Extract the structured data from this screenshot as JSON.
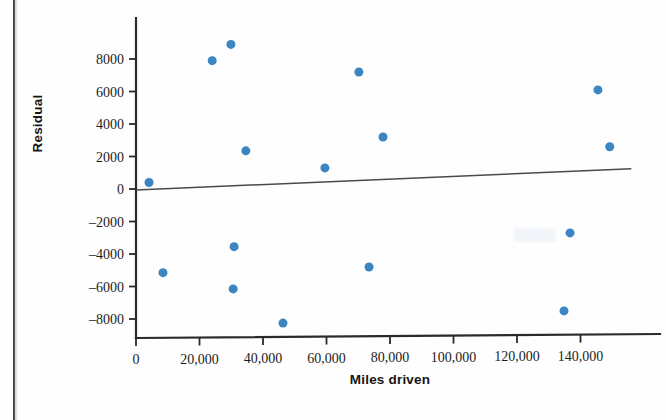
{
  "chart_data": {
    "type": "scatter",
    "title": "",
    "xlabel": "Miles driven",
    "ylabel": "Residual",
    "xlim": [
      0,
      156000
    ],
    "ylim": [
      -9200,
      9800
    ],
    "xticks": [
      0,
      20000,
      40000,
      60000,
      80000,
      100000,
      120000,
      140000
    ],
    "xticklabels": [
      "0",
      "20,000",
      "40,000",
      "60,000",
      "80,000",
      "100,000",
      "120,000",
      "140,000"
    ],
    "yticks": [
      -8000,
      -6000,
      -4000,
      -2000,
      0,
      2000,
      4000,
      6000,
      8000
    ],
    "yticklabels": [
      "–8000",
      "–6000",
      "–4000",
      "–2000",
      "0",
      "2000",
      "4000",
      "6000",
      "8000"
    ],
    "grid": false,
    "legend": null,
    "marker_color": "#3c85c3",
    "marker_size": 9,
    "reference_line": {
      "name": "residual-zero-line",
      "x": [
        0,
        156000
      ],
      "y": [
        -60,
        1250
      ],
      "color": "#4a4a4a"
    },
    "points": [
      {
        "x": 4100,
        "y": 400
      },
      {
        "x": 8500,
        "y": -5150
      },
      {
        "x": 24000,
        "y": 7900
      },
      {
        "x": 29900,
        "y": 8900
      },
      {
        "x": 30600,
        "y": -6150
      },
      {
        "x": 30900,
        "y": -3550
      },
      {
        "x": 34600,
        "y": 2350
      },
      {
        "x": 46300,
        "y": -8250
      },
      {
        "x": 59500,
        "y": 1300
      },
      {
        "x": 70200,
        "y": 7200
      },
      {
        "x": 73400,
        "y": -4800
      },
      {
        "x": 77800,
        "y": 3200
      },
      {
        "x": 134800,
        "y": -7500
      },
      {
        "x": 136700,
        "y": -2700
      },
      {
        "x": 145500,
        "y": 6100
      },
      {
        "x": 149200,
        "y": 2600
      }
    ]
  },
  "axis_titles": {
    "y": "Residual",
    "x": "Miles driven"
  }
}
